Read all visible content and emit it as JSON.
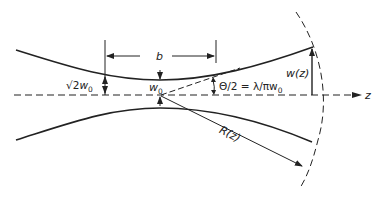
{
  "diagram": {
    "labels": {
      "b": "b",
      "sqrt2w0_root": "√2",
      "sqrt2w0_w": "w",
      "sqrt2w0_sub": "0",
      "w0_w": "w",
      "w0_sub": "0",
      "theta": "Θ/2 = λ/πw",
      "theta_sub": "0",
      "wz": "w(z)",
      "Rz": "R(z)",
      "z": "z"
    },
    "colors": {
      "line": "#222222",
      "background": "#ffffff"
    }
  }
}
